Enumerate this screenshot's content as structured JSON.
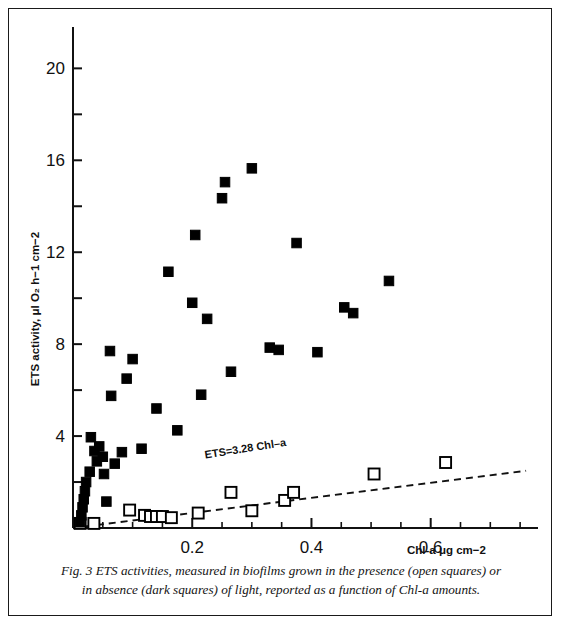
{
  "figure": {
    "caption_line_1": "Fig. 3 ETS activities, measured in biofilms grown in the presence (open squares) or",
    "caption_line_2": "in absence (dark squares) of light, reported as a function of Chl-a amounts.",
    "border_color": "#1a1a1a",
    "background_color": "#ffffff"
  },
  "chart_data": {
    "type": "scatter",
    "title": "",
    "xlabel": "Chl-a μg cm−2",
    "ylabel": "ETS activity, μl O₂ h−1 cm−2",
    "xlim": [
      0,
      0.78
    ],
    "ylim": [
      0,
      21.8
    ],
    "xticks": [
      0.2,
      0.4,
      0.6
    ],
    "xtick_labels": [
      "0.2",
      "0.4",
      "0.6"
    ],
    "xtick_minor_step": 0.05,
    "yticks": [
      4,
      8,
      12,
      16,
      20
    ],
    "ytick_labels": [
      "4",
      "8",
      "12",
      "16",
      "20"
    ],
    "ytick_minor_step": 2,
    "grid": false,
    "legend_position": "none",
    "marker_color": "#000000",
    "series": [
      {
        "name": "dark squares",
        "label": "in absence of light (dark squares)",
        "marker": "filled-square",
        "points": [
          [
            0.012,
            0.25
          ],
          [
            0.014,
            0.55
          ],
          [
            0.016,
            0.9
          ],
          [
            0.018,
            1.25
          ],
          [
            0.02,
            1.6
          ],
          [
            0.022,
            2.0
          ],
          [
            0.028,
            2.45
          ],
          [
            0.03,
            3.95
          ],
          [
            0.036,
            3.35
          ],
          [
            0.04,
            2.9
          ],
          [
            0.044,
            3.55
          ],
          [
            0.05,
            3.1
          ],
          [
            0.052,
            2.35
          ],
          [
            0.056,
            1.15
          ],
          [
            0.062,
            7.7
          ],
          [
            0.064,
            5.75
          ],
          [
            0.07,
            2.8
          ],
          [
            0.082,
            3.3
          ],
          [
            0.09,
            6.5
          ],
          [
            0.1,
            7.35
          ],
          [
            0.115,
            3.45
          ],
          [
            0.14,
            5.2
          ],
          [
            0.16,
            11.15
          ],
          [
            0.175,
            4.25
          ],
          [
            0.2,
            9.8
          ],
          [
            0.205,
            12.75
          ],
          [
            0.215,
            5.8
          ],
          [
            0.225,
            9.1
          ],
          [
            0.25,
            14.35
          ],
          [
            0.255,
            15.05
          ],
          [
            0.265,
            6.8
          ],
          [
            0.3,
            15.65
          ],
          [
            0.33,
            7.85
          ],
          [
            0.345,
            7.75
          ],
          [
            0.375,
            12.4
          ],
          [
            0.41,
            7.65
          ],
          [
            0.455,
            9.6
          ],
          [
            0.47,
            9.35
          ],
          [
            0.53,
            10.75
          ]
        ]
      },
      {
        "name": "open squares",
        "label": "in the presence of light (open squares)",
        "marker": "open-square",
        "points": [
          [
            0.012,
            0.2
          ],
          [
            0.035,
            0.2
          ],
          [
            0.095,
            0.78
          ],
          [
            0.12,
            0.55
          ],
          [
            0.13,
            0.5
          ],
          [
            0.14,
            0.5
          ],
          [
            0.15,
            0.5
          ],
          [
            0.165,
            0.45
          ],
          [
            0.21,
            0.65
          ],
          [
            0.265,
            1.55
          ],
          [
            0.3,
            0.75
          ],
          [
            0.355,
            1.2
          ],
          [
            0.37,
            1.55
          ],
          [
            0.505,
            2.35
          ],
          [
            0.625,
            2.85
          ]
        ]
      }
    ],
    "annotations": [
      {
        "name": "regression-equation",
        "text": "ETS=3.28 Chl–a",
        "x": 0.29,
        "y": 3.3,
        "rotation": -9
      }
    ],
    "fit_line": {
      "name": "regression-line",
      "style": "dashed",
      "slope": 3.28,
      "intercept": 0.0,
      "x_start": 0.0,
      "x_end": 0.76,
      "y_start": 0.0,
      "y_end": 2.49
    }
  }
}
